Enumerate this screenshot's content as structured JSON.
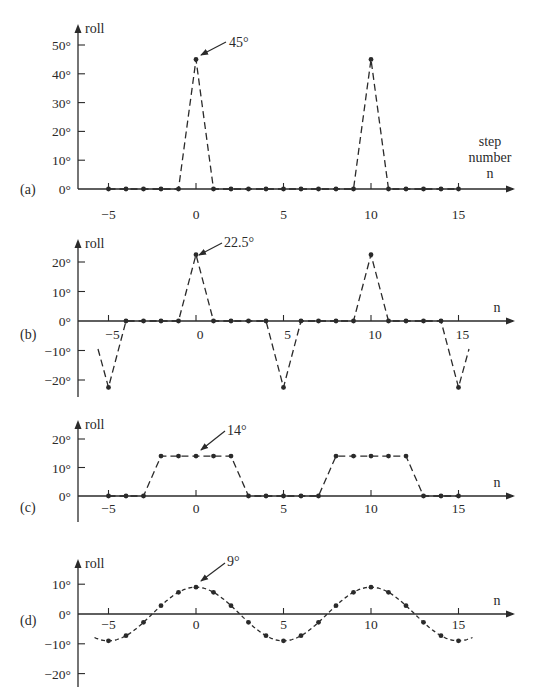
{
  "figure": {
    "x_axis_name": "n",
    "x_axis_name_full": [
      "step",
      "number",
      "n"
    ],
    "y_axis_name": "roll",
    "x_tick_labels": [
      "−5",
      "0",
      "5",
      "10",
      "15"
    ],
    "x_ticks": [
      -5,
      0,
      5,
      10,
      15
    ]
  },
  "chart_data": [
    {
      "type": "scatter",
      "panel_label": "(a)",
      "title": "",
      "xlabel": "step number n",
      "ylabel": "roll",
      "ylim": [
        0,
        55
      ],
      "y_ticks": [
        0,
        10,
        20,
        30,
        40,
        50
      ],
      "y_tick_labels": [
        "0°",
        "10°",
        "20°",
        "30°",
        "40°",
        "50°"
      ],
      "annotation": "45°",
      "x": [
        -5,
        -4,
        -3,
        -2,
        -1,
        0,
        1,
        2,
        3,
        4,
        5,
        6,
        7,
        8,
        9,
        10,
        11,
        12,
        13,
        14,
        15
      ],
      "values": [
        0,
        0,
        0,
        0,
        0,
        45,
        0,
        0,
        0,
        0,
        0,
        0,
        0,
        0,
        0,
        45,
        0,
        0,
        0,
        0,
        0
      ],
      "connector": "dashed"
    },
    {
      "type": "scatter",
      "panel_label": "(b)",
      "title": "",
      "xlabel": "n",
      "ylabel": "roll",
      "ylim": [
        -25,
        25
      ],
      "y_ticks": [
        -20,
        -10,
        0,
        10,
        20
      ],
      "y_tick_labels": [
        "−20°",
        "−10°",
        "0°",
        "10°",
        "20°"
      ],
      "annotation": "22.5°",
      "x": [
        -5,
        -4,
        -3,
        -2,
        -1,
        0,
        1,
        2,
        3,
        4,
        5,
        6,
        7,
        8,
        9,
        10,
        11,
        12,
        13,
        14,
        15
      ],
      "values": [
        -22.5,
        0,
        0,
        0,
        0,
        22.5,
        0,
        0,
        0,
        0,
        -22.5,
        0,
        0,
        0,
        0,
        22.5,
        0,
        0,
        0,
        0,
        -22.5
      ],
      "connector": "dashed"
    },
    {
      "type": "scatter",
      "panel_label": "(c)",
      "title": "",
      "xlabel": "n",
      "ylabel": "roll",
      "ylim": [
        -10,
        25
      ],
      "y_ticks": [
        0,
        10,
        20
      ],
      "y_tick_labels": [
        "0°",
        "10°",
        "20°"
      ],
      "annotation": "14°",
      "x": [
        -5,
        -4,
        -3,
        -2,
        -1,
        0,
        1,
        2,
        3,
        4,
        5,
        6,
        7,
        8,
        9,
        10,
        11,
        12,
        13,
        14,
        15
      ],
      "values": [
        0,
        0,
        0,
        14,
        14,
        14,
        14,
        14,
        0,
        0,
        0,
        0,
        0,
        14,
        14,
        14,
        14,
        14,
        0,
        0,
        0
      ],
      "connector": "dashed"
    },
    {
      "type": "scatter",
      "panel_label": "(d)",
      "title": "",
      "xlabel": "n",
      "ylabel": "roll",
      "ylim": [
        -25,
        15
      ],
      "y_ticks": [
        -20,
        -10,
        0,
        10
      ],
      "y_tick_labels": [
        "−20°",
        "−10°",
        "0°",
        "10°"
      ],
      "annotation": "9°",
      "x": [
        -5,
        -4,
        -3,
        -2,
        -1,
        0,
        1,
        2,
        3,
        4,
        5,
        6,
        7,
        8,
        9,
        10,
        11,
        12,
        13,
        14,
        15
      ],
      "values": [
        -9,
        -7.28,
        -2.78,
        2.78,
        7.28,
        9,
        7.28,
        2.78,
        -2.78,
        -7.28,
        -9,
        -7.28,
        -2.78,
        2.78,
        7.28,
        9,
        7.28,
        2.78,
        -2.78,
        -7.28,
        -9
      ],
      "connector": "dashed smooth curve (9·cos(2πn/10))"
    }
  ]
}
